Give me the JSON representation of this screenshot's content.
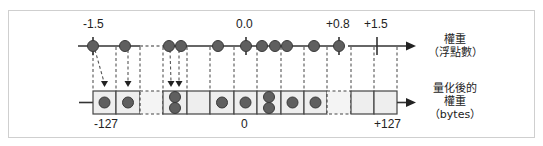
{
  "float_axis": {
    "label_line1": "權重",
    "label_line2": "（浮點數）",
    "tick_labels": [
      {
        "text": "-1.5",
        "x": 93
      },
      {
        "text": "0.0",
        "x": 246
      },
      {
        "text": "+0.8",
        "x": 339
      },
      {
        "text": "+1.5",
        "x": 377
      }
    ],
    "dots_x": [
      93,
      125,
      169,
      181,
      218,
      246,
      262,
      275,
      287,
      314,
      339
    ]
  },
  "quantized_axis": {
    "label_line1": "量化後的",
    "label_line2": "權重",
    "label_line3": "（bytes）",
    "tick_labels": [
      {
        "text": "-127",
        "x": 97
      },
      {
        "text": "0",
        "x": 245
      },
      {
        "text": "+127",
        "x": 385
      }
    ],
    "cells": [
      {
        "dots": 1,
        "dashed": false
      },
      {
        "dots": 1,
        "dashed": false
      },
      {
        "dots": 0,
        "dashed": true
      },
      {
        "dots": 2,
        "dashed": false
      },
      {
        "dots": 0,
        "dashed": false
      },
      {
        "dots": 1,
        "dashed": false
      },
      {
        "dots": 1,
        "dashed": false
      },
      {
        "dots": 2,
        "dashed": false
      },
      {
        "dots": 1,
        "dashed": false
      },
      {
        "dots": 1,
        "dashed": false
      },
      {
        "dots": 0,
        "dashed": true
      },
      {
        "dots": 0,
        "dashed": false
      },
      {
        "dots": 0,
        "dashed": false
      }
    ]
  },
  "colors": {
    "dot_fill": "#5f5f5f",
    "dot_stroke": "#3a3a3a",
    "line": "#333333",
    "cell_fill": "#eeeeee",
    "frame": "#cfcfcf"
  }
}
